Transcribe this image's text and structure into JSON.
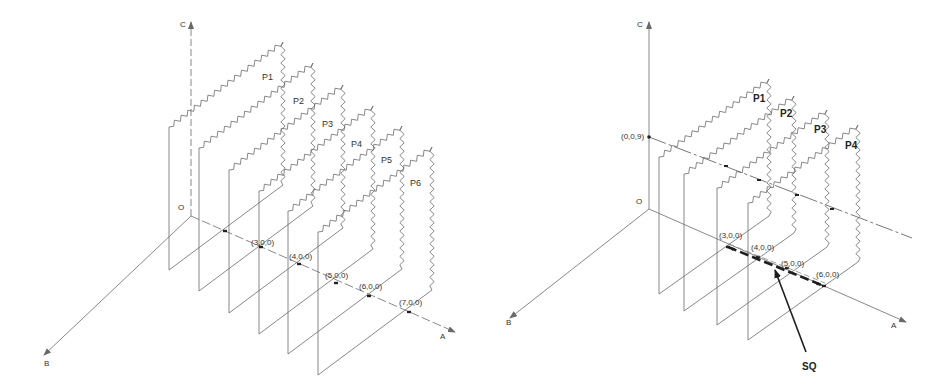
{
  "figure": {
    "colors": {
      "line": "#6a6a6a",
      "dark": "#1e1e1e",
      "dot": "#222222",
      "background": "#ffffff"
    },
    "panels": [
      {
        "id": "left",
        "axes": {
          "origin": [
            191,
            216
          ],
          "c_top": [
            191,
            22
          ],
          "b_tip": [
            44,
            355
          ],
          "a_tip": [
            455,
            332
          ],
          "labels": {
            "c": "C",
            "b": "B",
            "a": "A",
            "o": "O"
          },
          "label_pos": {
            "c": [
              180,
              27
            ],
            "b": [
              44,
              366
            ],
            "a": [
              440,
              339
            ],
            "o": [
              178,
              210
            ]
          }
        },
        "plane_vec": [
          114,
          -85
        ],
        "plane_height": 143,
        "planes": [
          {
            "label": "P1",
            "near_bottom": [
              169,
              270
            ],
            "label_pos": [
              262,
              80
            ]
          },
          {
            "label": "P2",
            "near_bottom": [
              199,
              291
            ],
            "label_pos": [
              293,
              104
            ]
          },
          {
            "label": "P3",
            "near_bottom": [
              229,
              313
            ],
            "label_pos": [
              322,
              127
            ]
          },
          {
            "label": "P4",
            "near_bottom": [
              259,
              334
            ],
            "label_pos": [
              351,
              147
            ]
          },
          {
            "label": "P5",
            "near_bottom": [
              288,
              354
            ],
            "label_pos": [
              381,
              163
            ]
          },
          {
            "label": "P6",
            "near_bottom": [
              318,
              375
            ],
            "label_pos": [
              410,
              186
            ]
          }
        ],
        "points": [
          {
            "label": "",
            "pos": [
              225,
              231
            ]
          },
          {
            "label": "(3,0,0)",
            "pos": [
              261,
              247
            ],
            "label_pos": [
              251,
              245
            ]
          },
          {
            "label": "(4,0,0)",
            "pos": [
              299,
              264
            ],
            "label_pos": [
              289,
              259
            ]
          },
          {
            "label": "(5,0,0)",
            "pos": [
              336,
              283
            ],
            "label_pos": [
              325,
              278
            ]
          },
          {
            "label": "(6,0,0)",
            "pos": [
              369,
              296
            ],
            "label_pos": [
              359,
              289
            ]
          },
          {
            "label": "(7,0,0)",
            "pos": [
              409,
              312
            ],
            "label_pos": [
              399,
              305
            ]
          }
        ]
      },
      {
        "id": "right",
        "axes": {
          "origin": [
            649,
            209
          ],
          "c_top": [
            649,
            22
          ],
          "b_tip": [
            510,
            318
          ],
          "a_tip": [
            906,
            322
          ],
          "labels": {
            "c": "C",
            "b": "B",
            "a": "A",
            "o": "O"
          },
          "label_pos": {
            "c": [
              637,
              27
            ],
            "b": [
              506,
              325
            ],
            "a": [
              891,
              328
            ],
            "o": [
              636,
              204
            ]
          }
        },
        "cut_line": {
          "from": [
            649,
            137
          ],
          "to": [
            912,
            238
          ],
          "label": "(0,0,9)",
          "label_pos": [
            621,
            139
          ]
        },
        "plane_vec": [
          110,
          -78
        ],
        "plane_height": 137,
        "planes": [
          {
            "label": "P1",
            "near_bottom": [
              659,
              294
            ],
            "label_pos": [
              753,
              102
            ]
          },
          {
            "label": "P2",
            "near_bottom": [
              684,
              311
            ],
            "label_pos": [
              780,
              117
            ]
          },
          {
            "label": "P3",
            "near_bottom": [
              717,
              325
            ],
            "label_pos": [
              814,
              133
            ]
          },
          {
            "label": "P4",
            "near_bottom": [
              748,
              340
            ],
            "label_pos": [
              845,
              149
            ]
          }
        ],
        "cut_points": [
          [
            726,
            166
          ],
          [
            759,
            180
          ],
          [
            797,
            195
          ],
          [
            832,
            209
          ]
        ],
        "points": [
          {
            "label": "(3,0,0)",
            "pos": [
              728,
              247
            ],
            "label_pos": [
              719,
              238
            ]
          },
          {
            "label": "(4,0,0)",
            "pos": [
              758,
              257
            ],
            "label_pos": [
              751,
              250
            ]
          },
          {
            "label": "(5,0,0)",
            "pos": [
              787,
              268
            ],
            "label_pos": [
              781,
              266
            ]
          },
          {
            "label": "(6,0,0)",
            "pos": [
              824,
              286
            ],
            "label_pos": [
              816,
              277
            ]
          }
        ],
        "sq": {
          "label": "SQ",
          "arrow_from": [
            806,
            352
          ],
          "arrow_to": [
            775,
            270
          ],
          "label_pos": [
            802,
            370
          ]
        }
      }
    ]
  }
}
